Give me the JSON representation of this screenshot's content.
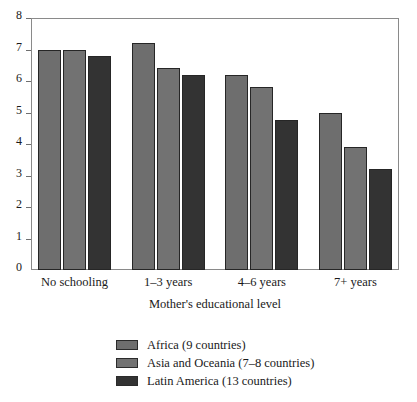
{
  "chart_data": {
    "type": "bar",
    "title": "",
    "subtitle": "",
    "xlabel": "Mother's educational level",
    "ylabel": "",
    "categories": [
      "No schooling",
      "1–3 years",
      "4–6 years",
      "7+ years"
    ],
    "series": [
      {
        "name": "Africa (9 countries)",
        "color": "#6e6e6e",
        "values": [
          7.0,
          7.2,
          6.2,
          5.0
        ]
      },
      {
        "name": "Asia and Oceania (7–8 countries)",
        "color": "#727272",
        "values": [
          7.0,
          6.4,
          5.8,
          3.9
        ]
      },
      {
        "name": "Latin America (13 countries)",
        "color": "#333333",
        "values": [
          6.8,
          6.2,
          4.75,
          3.2
        ]
      }
    ],
    "ylim": [
      0,
      8
    ],
    "yticks": [
      0,
      1,
      2,
      3,
      4,
      5,
      6,
      7,
      8
    ],
    "ytick_labels": [
      "0",
      "1",
      "2",
      "3",
      "4",
      "5",
      "6",
      "7",
      "8"
    ],
    "grid": false,
    "legend_position": "bottom-center",
    "frame": true,
    "bar_border_color": "#262626",
    "axis_color": "#8a8a8a",
    "background_color": "#ffffff"
  },
  "legend": {
    "items": [
      {
        "label": "Africa (9 countries)",
        "color": "#6e6e6e"
      },
      {
        "label": "Asia and Oceania (7–8 countries)",
        "color": "#727272"
      },
      {
        "label": "Latin America (13 countries)",
        "color": "#333333"
      }
    ]
  }
}
